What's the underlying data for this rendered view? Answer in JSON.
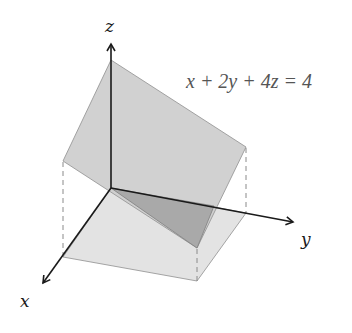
{
  "diagram": {
    "type": "3d-plane-plot",
    "equation": "x + 2y + 4z = 4",
    "axes": {
      "x": {
        "label": "x"
      },
      "y": {
        "label": "y"
      },
      "z": {
        "label": "z"
      }
    },
    "colors": {
      "plane": "#c8c8c8",
      "floor": "#e2e2e2",
      "shadow_triangle": "#a8a8a8",
      "axis": "#1a1a1a",
      "dashed": "#8a8a8a",
      "equation_text": "#555555"
    }
  }
}
